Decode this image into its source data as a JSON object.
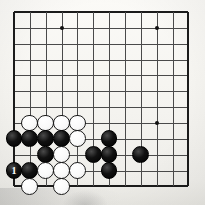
{
  "app": {
    "title": "Go board position diagram",
    "type": "go-board-diagram"
  },
  "board": {
    "game": "Go",
    "visible_columns": 12,
    "visible_rows": 12,
    "origin_x": 14,
    "origin_y": 12,
    "cell": 15.85,
    "grid_color": "#4a4a4a",
    "edge_color": "#1b1b1b",
    "background_color": "#f6f5f1",
    "edges": {
      "left": true,
      "top": true,
      "right": true,
      "bottom": true
    },
    "star_points": [
      {
        "col": 4,
        "row": 2,
        "label": "hoshi-top-left"
      },
      {
        "col": 10,
        "row": 2,
        "label": "hoshi-top-right"
      },
      {
        "col": 10,
        "row": 8,
        "label": "hoshi-lower-right"
      }
    ],
    "stones": [
      {
        "col": 2,
        "row": 8,
        "color": "white"
      },
      {
        "col": 3,
        "row": 8,
        "color": "white"
      },
      {
        "col": 4,
        "row": 8,
        "color": "white"
      },
      {
        "col": 5,
        "row": 8,
        "color": "white"
      },
      {
        "col": 1,
        "row": 9,
        "color": "black"
      },
      {
        "col": 2,
        "row": 9,
        "color": "black"
      },
      {
        "col": 3,
        "row": 9,
        "color": "black"
      },
      {
        "col": 4,
        "row": 9,
        "color": "black"
      },
      {
        "col": 5,
        "row": 9,
        "color": "white"
      },
      {
        "col": 7,
        "row": 9,
        "color": "black"
      },
      {
        "col": 3,
        "row": 10,
        "color": "black"
      },
      {
        "col": 4,
        "row": 10,
        "color": "white"
      },
      {
        "col": 6,
        "row": 10,
        "color": "black"
      },
      {
        "col": 7,
        "row": 10,
        "color": "black"
      },
      {
        "col": 9,
        "row": 10,
        "color": "black"
      },
      {
        "col": 1,
        "row": 11,
        "color": "black",
        "mark": "1"
      },
      {
        "col": 2,
        "row": 11,
        "color": "black"
      },
      {
        "col": 3,
        "row": 11,
        "color": "white"
      },
      {
        "col": 4,
        "row": 11,
        "color": "white"
      },
      {
        "col": 5,
        "row": 11,
        "color": "white"
      },
      {
        "col": 7,
        "row": 11,
        "color": "black"
      },
      {
        "col": 2,
        "row": 12,
        "color": "white"
      },
      {
        "col": 4,
        "row": 12,
        "color": "white"
      }
    ],
    "move_markers": [
      {
        "number": "1",
        "col": 1,
        "row": 11,
        "stone_color": "black",
        "text_color": "#ffffff"
      }
    ],
    "counts": {
      "black_stones": 12,
      "white_stones": 11,
      "total_stones": 23
    }
  }
}
